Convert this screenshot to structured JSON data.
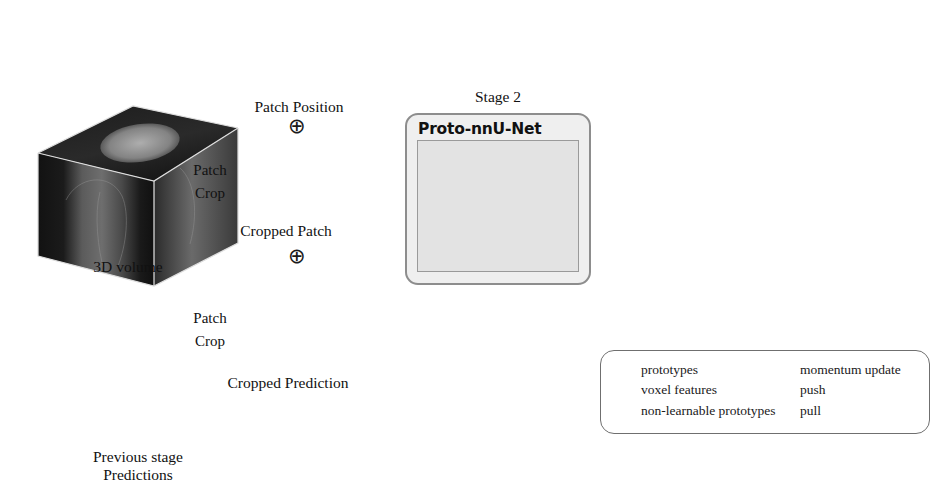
{
  "figure": {
    "divider": "vertical-dashed-separator"
  },
  "left_panel": {
    "volume_label": "3D volume",
    "prediction_label_line1": "Previous stage",
    "prediction_label_line2": "Predictions",
    "patch_position_label": "Patch Position",
    "cropped_patch_label": "Cropped Patch",
    "cropped_prediction_label": "Cropped Prediction",
    "arrow1_line1": "Patch",
    "arrow1_line2": "Crop",
    "arrow2_line1": "Patch",
    "arrow2_line2": "Crop",
    "plus_symbol": "⊕",
    "stage_title": "Stage 2",
    "model_name": "Proto-nnU-Net"
  },
  "right_panel": {
    "legend": {
      "items": [
        {
          "icon": "star-icon",
          "label": "prototypes"
        },
        {
          "icon": "circle-icon",
          "label": "voxel features"
        },
        {
          "icon": "square-icon",
          "label": "non-learnable prototypes"
        }
      ],
      "line_items": [
        {
          "icon": "solid-arrow-icon",
          "label": "momentum update"
        },
        {
          "icon": "dashed-arrow-icon",
          "label": "push"
        },
        {
          "icon": "dotted-arrow-icon",
          "label": "pull"
        }
      ]
    },
    "stars": [
      {
        "cx": 653,
        "cy": 175,
        "r": 13,
        "filled": false
      },
      {
        "cx": 707,
        "cy": 157,
        "r": 13,
        "filled": true
      },
      {
        "cx": 664,
        "cy": 262,
        "r": 13,
        "filled": true
      }
    ],
    "squares": [
      {
        "cx": 815,
        "cy": 171,
        "size": 30
      },
      {
        "cx": 780,
        "cy": 211,
        "size": 30
      },
      {
        "cx": 723,
        "cy": 262,
        "size": 30
      }
    ],
    "voxels": [
      {
        "cx": 701,
        "cy": 133,
        "r": 7
      },
      {
        "cx": 730,
        "cy": 122,
        "r": 7
      },
      {
        "cx": 721,
        "cy": 151,
        "r": 7
      },
      {
        "cx": 662,
        "cy": 170,
        "r": 5.5
      },
      {
        "cx": 666,
        "cy": 194,
        "r": 6.5
      },
      {
        "cx": 690,
        "cy": 221,
        "r": 6.5
      },
      {
        "cx": 690,
        "cy": 242,
        "r": 7
      },
      {
        "cx": 687,
        "cy": 284,
        "r": 7
      },
      {
        "cx": 864,
        "cy": 164,
        "r": 7
      },
      {
        "cx": 866,
        "cy": 180,
        "r": 7
      },
      {
        "cx": 821,
        "cy": 223,
        "r": 6
      },
      {
        "cx": 824,
        "cy": 240,
        "r": 6
      },
      {
        "cx": 785,
        "cy": 270,
        "r": 6.5
      },
      {
        "cx": 771,
        "cy": 283,
        "r": 6.5
      }
    ],
    "chart_note": "feature space cloud with prototype assignments"
  },
  "colors": {
    "cloud_fill": "#f0f0f0",
    "cloud_stroke": "#d2d2d2",
    "dark_marker": "#3b3b3b",
    "square_fill": "#8f8f8f",
    "square_border": "#2e2e2e",
    "line": "#5a5a5a",
    "card_bg": "#efefef",
    "card_border": "#8d8d8d",
    "unet_bg": "#e3e3e3",
    "divider": "#9b9b9b"
  }
}
